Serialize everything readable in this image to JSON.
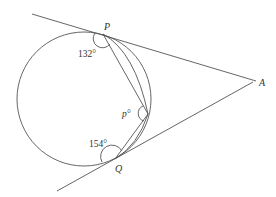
{
  "diagram": {
    "type": "circle-geometry",
    "stroke_color": "#555555",
    "background": "#ffffff",
    "labels": {
      "P": "P",
      "Q": "Q",
      "A": "A",
      "angle_P": "132°",
      "angle_R": "p°",
      "angle_Q": "154°"
    },
    "elements": [
      {
        "kind": "circle",
        "name": "circle"
      },
      {
        "kind": "line",
        "name": "tangent-through-P",
        "to": "A"
      },
      {
        "kind": "line",
        "name": "tangent-through-Q",
        "to": "A"
      },
      {
        "kind": "chord",
        "name": "chord-P-R"
      },
      {
        "kind": "chord",
        "name": "chord-R-Q"
      }
    ],
    "angles": [
      {
        "vertex": "P",
        "value": "132°"
      },
      {
        "vertex": "R",
        "value": "p°"
      },
      {
        "vertex": "Q",
        "value": "154°"
      }
    ]
  }
}
